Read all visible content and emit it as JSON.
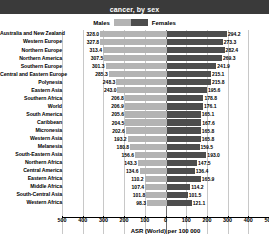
{
  "title": "cancer, by sex",
  "legend": {
    "male_label": "Males",
    "female_label": "Females",
    "male_color": "#b3b3b3",
    "female_color": "#4d4d4d"
  },
  "axis": {
    "label": "ASR (World) per 100 000",
    "ticks": [
      "500",
      "400",
      "300",
      "200",
      "100",
      "0",
      "100",
      "200",
      "300",
      "400",
      "500"
    ],
    "max": 500
  },
  "chart_data": {
    "type": "bar",
    "orientation": "horizontal-diverging",
    "title": "cancer, by sex",
    "xlabel": "ASR (World) per 100 000",
    "ylabel": "",
    "xlim": [
      -500,
      500
    ],
    "grid": true,
    "legend_position": "top-center",
    "categories": [
      "Australia and New Zealand",
      "Western Europe",
      "Northern Europe",
      "Northern America",
      "Southern Europe",
      "Central and Eastern Europe",
      "Polynesia",
      "Eastern Asia",
      "Southern Africa",
      "World",
      "South America",
      "Caribbean",
      "Micronesia",
      "Western Asia",
      "Melanesia",
      "South-Eastern Asia",
      "Northern Africa",
      "Central America",
      "Eastern Africa",
      "Middle Africa",
      "South-Central Asia",
      "Western Africa"
    ],
    "series": [
      {
        "name": "Males",
        "color": "#b3b3b3",
        "values": [
          328.0,
          327.8,
          313.4,
          307.5,
          301.3,
          285.3,
          248.3,
          243.0,
          206.8,
          206.9,
          205.6,
          204.5,
          202.6,
          193.2,
          180.8,
          156.6,
          143.3,
          134.6,
          110.2,
          107.4,
          101.8,
          98.3
        ]
      },
      {
        "name": "Females",
        "color": "#4d4d4d",
        "values": [
          294.2,
          273.3,
          282.4,
          269.3,
          241.9,
          215.1,
          215.8,
          195.6,
          178.8,
          176.1,
          165.1,
          167.6,
          165.8,
          165.8,
          159.5,
          193.0,
          147.5,
          136.4,
          165.9,
          114.2,
          101.5,
          121.1
        ]
      }
    ]
  }
}
